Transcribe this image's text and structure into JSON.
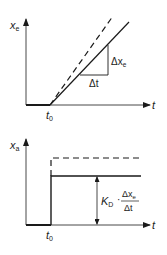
{
  "top_chart": {
    "y_axis_label": "x",
    "y_axis_sub": "e",
    "x_axis_label": "t",
    "t0_label": "t",
    "t0_sub": "0",
    "delta_x_label": "Δx",
    "delta_x_sub": "e",
    "delta_t_label": "Δt",
    "lines": [
      "solid ramp",
      "dashed ramp"
    ]
  },
  "bottom_chart": {
    "y_axis_label": "x",
    "y_axis_sub": "a",
    "x_axis_label": "t",
    "t0_label": "t",
    "t0_sub": "0",
    "gain_label": "K",
    "gain_sub": "D",
    "dot": "·",
    "frac_num": "Δx",
    "frac_num_sub": "e",
    "frac_den": "Δt",
    "lines": [
      "solid step",
      "dashed step"
    ]
  },
  "colors": {
    "line": "#1a1a1a",
    "axis": "#333333",
    "background": "#ffffff"
  }
}
